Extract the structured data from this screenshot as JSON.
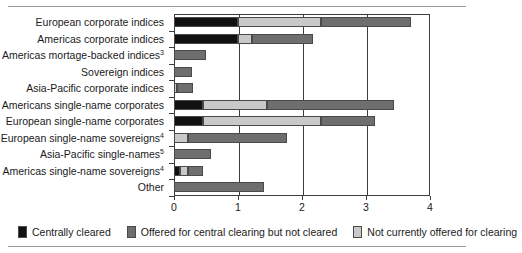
{
  "chart_data": {
    "type": "bar",
    "orientation": "horizontal",
    "stacked": true,
    "title": "",
    "subtitle": "",
    "xlabel": "",
    "ylabel": "",
    "xlim": [
      0,
      4
    ],
    "xticks": [
      0,
      1,
      2,
      3,
      4
    ],
    "xticklabels": [
      "0",
      "1",
      "2",
      "3",
      "4"
    ],
    "grid": "vertical",
    "legend_position": "bottom",
    "categories": [
      "European corporate indices",
      "Americas corporate indices",
      "Americas mortage-backed indices",
      "Sovereign indices",
      "Asia-Pacific corporate indices",
      "Americans single-name corporates",
      "European single-name corporates",
      "European single-name sovereigns",
      "Asia-Pacific single-names",
      "Americas single-name sovereigns",
      "Other"
    ],
    "category_footnotes": [
      "",
      "",
      "3",
      "",
      "",
      "",
      "",
      "4",
      "5",
      "4",
      ""
    ],
    "series": [
      {
        "name": "Centrally cleared",
        "color": "#111111",
        "values": [
          1.0,
          1.0,
          0.0,
          0.0,
          0.0,
          0.45,
          0.45,
          0.0,
          0.0,
          0.1,
          0.0
        ]
      },
      {
        "name": "Offered for central clearing but not cleared",
        "color": "#6e6e6e",
        "values": [
          0.0,
          0.0,
          0.5,
          0.28,
          0.26,
          0.0,
          0.0,
          1.55,
          0.58,
          0.23,
          1.4
        ]
      },
      {
        "name": "Not currently offered for clearing",
        "color": "#c9c9c9",
        "values": [
          1.3,
          0.22,
          0.0,
          0.0,
          0.04,
          1.0,
          1.85,
          0.22,
          0.0,
          0.12,
          0.0
        ]
      }
    ],
    "stack_order_per_category": [
      [
        "Centrally cleared",
        "Not currently offered for clearing",
        "Offered for central clearing but not cleared"
      ],
      [
        "Centrally cleared",
        "Not currently offered for clearing",
        "Offered for central clearing but not cleared"
      ],
      [
        "Offered for central clearing but not cleared"
      ],
      [
        "Offered for central clearing but not cleared"
      ],
      [
        "Not currently offered for clearing",
        "Offered for central clearing but not cleared"
      ],
      [
        "Centrally cleared",
        "Not currently offered for clearing",
        "Offered for central clearing but not cleared"
      ],
      [
        "Centrally cleared",
        "Not currently offered for clearing",
        "Offered for central clearing but not cleared"
      ],
      [
        "Not currently offered for clearing",
        "Offered for central clearing but not cleared"
      ],
      [
        "Offered for central clearing but not cleared"
      ],
      [
        "Centrally cleared",
        "Not currently offered for clearing",
        "Offered for central clearing but not cleared"
      ],
      [
        "Offered for central clearing but not cleared"
      ]
    ],
    "totals": [
      3.7,
      2.17,
      0.5,
      0.28,
      0.3,
      1.45,
      2.3,
      1.77,
      0.58,
      0.45,
      1.4
    ],
    "bars": [
      {
        "category": "European corporate indices",
        "segments": [
          {
            "series": "Centrally cleared",
            "start": 0.0,
            "end": 1.0,
            "color": "#111111"
          },
          {
            "series": "Not currently offered for clearing",
            "start": 1.0,
            "end": 2.3,
            "color": "#c9c9c9"
          },
          {
            "series": "Offered for central clearing but not cleared",
            "start": 2.3,
            "end": 3.7,
            "color": "#6e6e6e"
          }
        ]
      },
      {
        "category": "Americas corporate indices",
        "segments": [
          {
            "series": "Centrally cleared",
            "start": 0.0,
            "end": 1.0,
            "color": "#111111"
          },
          {
            "series": "Not currently offered for clearing",
            "start": 1.0,
            "end": 1.22,
            "color": "#c9c9c9"
          },
          {
            "series": "Offered for central clearing but not cleared",
            "start": 1.22,
            "end": 2.17,
            "color": "#6e6e6e"
          }
        ]
      },
      {
        "category": "Americas mortage-backed indices",
        "segments": [
          {
            "series": "Offered for central clearing but not cleared",
            "start": 0.0,
            "end": 0.5,
            "color": "#6e6e6e"
          }
        ]
      },
      {
        "category": "Sovereign indices",
        "segments": [
          {
            "series": "Offered for central clearing but not cleared",
            "start": 0.0,
            "end": 0.28,
            "color": "#6e6e6e"
          }
        ]
      },
      {
        "category": "Asia-Pacific corporate indices",
        "segments": [
          {
            "series": "Not currently offered for clearing",
            "start": 0.0,
            "end": 0.05,
            "color": "#c9c9c9"
          },
          {
            "series": "Offered for central clearing but not cleared",
            "start": 0.05,
            "end": 0.3,
            "color": "#6e6e6e"
          }
        ]
      },
      {
        "category": "Americans single-name corporates",
        "segments": [
          {
            "series": "Centrally cleared",
            "start": 0.0,
            "end": 0.45,
            "color": "#111111"
          },
          {
            "series": "Not currently offered for clearing",
            "start": 0.45,
            "end": 1.45,
            "color": "#c9c9c9"
          },
          {
            "series": "Offered for central clearing but not cleared",
            "start": 1.45,
            "end": 3.44,
            "color": "#6e6e6e"
          }
        ]
      },
      {
        "category": "European single-name corporates",
        "segments": [
          {
            "series": "Centrally cleared",
            "start": 0.0,
            "end": 0.45,
            "color": "#111111"
          },
          {
            "series": "Not currently offered for clearing",
            "start": 0.45,
            "end": 2.3,
            "color": "#c9c9c9"
          },
          {
            "series": "Offered for central clearing but not cleared",
            "start": 2.3,
            "end": 3.14,
            "color": "#6e6e6e"
          }
        ]
      },
      {
        "category": "European single-name sovereigns",
        "segments": [
          {
            "series": "Not currently offered for clearing",
            "start": 0.0,
            "end": 0.22,
            "color": "#c9c9c9"
          },
          {
            "series": "Offered for central clearing but not cleared",
            "start": 0.22,
            "end": 1.77,
            "color": "#6e6e6e"
          }
        ]
      },
      {
        "category": "Asia-Pacific single-names",
        "segments": [
          {
            "series": "Offered for central clearing but not cleared",
            "start": 0.0,
            "end": 0.58,
            "color": "#6e6e6e"
          }
        ]
      },
      {
        "category": "Americas single-name sovereigns",
        "segments": [
          {
            "series": "Centrally cleared",
            "start": 0.0,
            "end": 0.1,
            "color": "#111111"
          },
          {
            "series": "Not currently offered for clearing",
            "start": 0.1,
            "end": 0.22,
            "color": "#c9c9c9"
          },
          {
            "series": "Offered for central clearing but not cleared",
            "start": 0.22,
            "end": 0.45,
            "color": "#6e6e6e"
          }
        ]
      },
      {
        "category": "Other",
        "segments": [
          {
            "series": "Offered for central clearing but not cleared",
            "start": 0.0,
            "end": 1.4,
            "color": "#6e6e6e"
          }
        ]
      }
    ],
    "legend": [
      {
        "label": "Centrally cleared",
        "color": "#111111"
      },
      {
        "label": "Offered for central clearing but not cleared",
        "color": "#6e6e6e"
      },
      {
        "label": "Not currently offered for clearing",
        "color": "#c9c9c9"
      }
    ]
  }
}
